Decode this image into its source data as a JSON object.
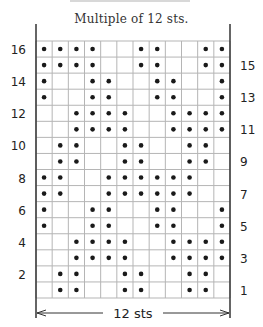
{
  "chart_data": {
    "type": "heatmap",
    "title": "",
    "subtitle": "Multiple of 12 sts.",
    "columns": 12,
    "rows": 16,
    "width_label": "12 sts",
    "left_labels": [
      "16",
      "14",
      "12",
      "10",
      "8",
      "6",
      "4",
      "2"
    ],
    "right_labels": [
      "15",
      "13",
      "11",
      "9",
      "7",
      "5",
      "3",
      "1"
    ],
    "symbol": "purl-dot",
    "grid": true,
    "colors": {
      "grid": "#b5b5b5",
      "dot": "#1a1a1a",
      "frame": "#333333"
    },
    "pattern": [
      {
        "row": 16,
        "dots": [
          1,
          2,
          3,
          4,
          7,
          8,
          11,
          12
        ]
      },
      {
        "row": 15,
        "dots": [
          1,
          2,
          3,
          4,
          7,
          8,
          11,
          12
        ]
      },
      {
        "row": 14,
        "dots": [
          1,
          4,
          5,
          8,
          9,
          12
        ]
      },
      {
        "row": 13,
        "dots": [
          1,
          4,
          5,
          8,
          9,
          12
        ]
      },
      {
        "row": 12,
        "dots": [
          3,
          4,
          5,
          6,
          9,
          10,
          11,
          12
        ]
      },
      {
        "row": 11,
        "dots": [
          3,
          4,
          5,
          6,
          9,
          10,
          11,
          12
        ]
      },
      {
        "row": 10,
        "dots": [
          2,
          3,
          6,
          7,
          10,
          11
        ]
      },
      {
        "row": 9,
        "dots": [
          2,
          3,
          6,
          7,
          10,
          11
        ]
      },
      {
        "row": 8,
        "dots": [
          1,
          2,
          5,
          6,
          7,
          8,
          9,
          10
        ]
      },
      {
        "row": 7,
        "dots": [
          1,
          2,
          5,
          6,
          7,
          8,
          9,
          10
        ]
      },
      {
        "row": 6,
        "dots": [
          1,
          4,
          5,
          8,
          9,
          12
        ]
      },
      {
        "row": 5,
        "dots": [
          1,
          4,
          5,
          8,
          9,
          12
        ]
      },
      {
        "row": 4,
        "dots": [
          3,
          4,
          5,
          6,
          9,
          10,
          11,
          12
        ]
      },
      {
        "row": 3,
        "dots": [
          3,
          4,
          5,
          6,
          9,
          10,
          11,
          12
        ]
      },
      {
        "row": 2,
        "dots": [
          2,
          3,
          6,
          7,
          10,
          11
        ]
      },
      {
        "row": 1,
        "dots": [
          2,
          3,
          6,
          7,
          10,
          11
        ]
      }
    ]
  }
}
